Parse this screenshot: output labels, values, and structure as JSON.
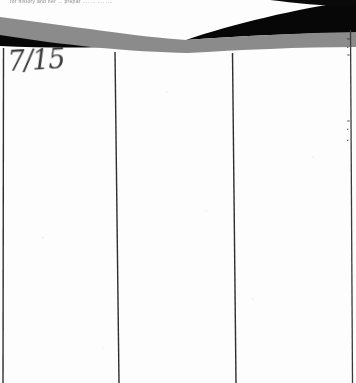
{
  "document": {
    "kind": "scanned-ledger-page",
    "top_clipped_text": "for  history  and  ner  ... prepar ....   ...  .... ....",
    "handwritten_date": "7/15",
    "right_edge_fragments": {
      "a": "=",
      "b": "▪",
      "c": "=",
      "d": "=",
      "e": "▪",
      "f": "▪"
    }
  },
  "artifact": {
    "label": "scanner-shadow",
    "black_color": "#070707",
    "gray_color": "#8b8b8b"
  },
  "rules": {
    "label": "column-rules",
    "color": "#2e2e2e",
    "columns": [
      {
        "name": "column-1",
        "label": ""
      },
      {
        "name": "column-2",
        "label": ""
      },
      {
        "name": "column-3",
        "label": ""
      }
    ]
  },
  "paper": {
    "color": "#fdfdfd"
  }
}
